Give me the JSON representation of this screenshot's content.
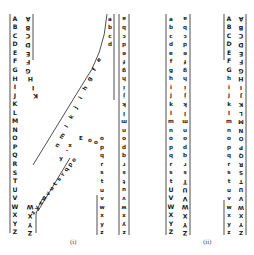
{
  "figure": {
    "panels": [
      {
        "label": "(i)",
        "strips": [
          {
            "name": "left-upper-outer",
            "letters": "ABCDEFGHIJKLMNOPQRSTUVWXYZ"
          },
          {
            "name": "left-inverted",
            "letters": "ABCDEFGHIK"
          },
          {
            "name": "diagonal-upper",
            "letters": "efghijklmn"
          },
          {
            "name": "diagonal-lower",
            "letters": "opqrstuvwxyz"
          },
          {
            "name": "right-lower",
            "letters": "abcdefghijklmnopqrstuvwxyz"
          },
          {
            "name": "right-inverted",
            "letters": "abcdefghijklmnopqrstuvwxyz"
          }
        ]
      },
      {
        "label": "(ii)",
        "strips": [
          {
            "name": "lower-left",
            "letters": "abcdefghijklmnopqrstUVWXYZ"
          },
          {
            "name": "lower-inverted",
            "letters": "abcdefghijklmnopqrsTUVWXYZ"
          },
          {
            "name": "upper-left",
            "letters": "ABCDEFGhijklmnopqrstuvwxyz"
          },
          {
            "name": "upper-inverted",
            "letters": "ABCDEFGHIJKLMNOPQRSTUVWXYZ"
          }
        ]
      }
    ]
  }
}
